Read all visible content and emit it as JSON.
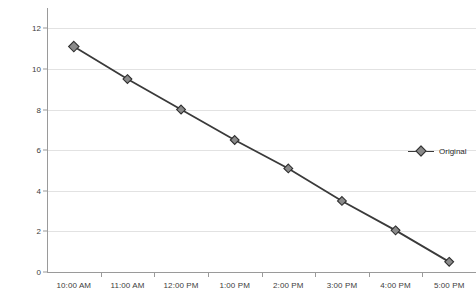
{
  "chart_data": {
    "type": "line",
    "title": "",
    "xlabel": "",
    "ylabel": "",
    "categories": [
      "10:00 AM",
      "11:00 AM",
      "12:00 PM",
      "1:00 PM",
      "2:00 PM",
      "3:00 PM",
      "4:00 PM",
      "5:00 PM"
    ],
    "series": [
      {
        "name": "Original",
        "values": [
          11.1,
          9.5,
          8.0,
          6.5,
          5.1,
          3.5,
          2.05,
          0.5
        ],
        "line_color": "#3a3a3a",
        "marker_color": "#8a8a8a",
        "marker_edge_color": "#2f2f2f",
        "marker": "diamond"
      }
    ],
    "ylim": [
      0,
      13
    ],
    "yticks": [
      0,
      2,
      4,
      6,
      8,
      10,
      12
    ],
    "ytick_labels": [
      "0",
      "2",
      "4",
      "6",
      "8",
      "10",
      "12"
    ],
    "grid": "horizontal",
    "grid_color": "#e2e2e2",
    "axis_color": "#9a9a9a",
    "background": "#ffffff",
    "legend": {
      "position": "right",
      "entries": [
        "Original"
      ]
    }
  }
}
